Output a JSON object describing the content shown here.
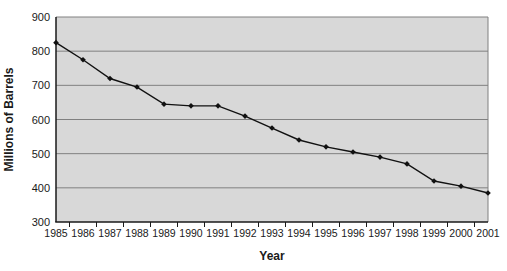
{
  "chart_data": {
    "type": "line",
    "title": "",
    "xlabel": "Year",
    "ylabel": "Millions of Barrels",
    "x": [
      1985,
      1986,
      1987,
      1988,
      1989,
      1990,
      1991,
      1992,
      1993,
      1994,
      1995,
      1996,
      1997,
      1998,
      1999,
      2000,
      2001
    ],
    "series": [
      {
        "name": "Millions of Barrels",
        "values": [
          825,
          775,
          720,
          695,
          645,
          640,
          640,
          610,
          575,
          540,
          520,
          505,
          490,
          470,
          420,
          405,
          385
        ]
      }
    ],
    "ylim": [
      300,
      900
    ],
    "ytick_step": 100,
    "yticks": [
      300,
      400,
      500,
      600,
      700,
      800,
      900
    ],
    "grid": "horizontal",
    "legend": "none",
    "marker": "diamond",
    "colors": {
      "plot_background": "#d8d8d8",
      "gridline": "#808080",
      "axis": "#1a1a1a",
      "line": "#111111",
      "marker": "#111111",
      "text": "#1a1a1a",
      "page_background": "#ffffff"
    }
  }
}
